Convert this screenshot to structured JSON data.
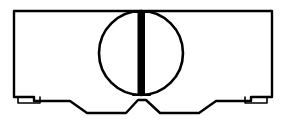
{
  "figure": {
    "kind": "technical-line-drawing",
    "canvas": {
      "width": 285,
      "height": 132,
      "background": "#ffffff"
    },
    "ink_color": "#000000",
    "fill_color": "#ffffff"
  },
  "geometry": {
    "body_outline": {
      "name": "cabinet-body-outline",
      "description": "Rectangular cabinet front with stepped and notched lower edge",
      "stroke_width": 2.4,
      "path": "M 14 11 L 272 11 L 272 97 L 251 97 L 251 101 L 216 101 L 199 113 L 160 113 L 146 100 L 138 100 L 126 113 L 87 113 L 70 101 L 34 101 L 34 97 L 14 97 Z"
    },
    "left_foot": {
      "name": "left-foot",
      "description": "Small rectangular support foot at lower left",
      "stroke_width": 1.6,
      "path": "M 18 97 L 18 103 L 40 103 L 40 97"
    },
    "right_foot": {
      "name": "right-foot",
      "description": "Small rectangular support foot at lower right",
      "stroke_width": 1.6,
      "path": "M 245 97 L 245 103 L 267 103 L 267 97"
    },
    "drum_circle": {
      "name": "drum-circle",
      "description": "Large circular drum / porthole centred on the cabinet face",
      "center_x": 141,
      "center_y": 53,
      "radius": 42,
      "stroke_width": 2.6
    },
    "center_bar": {
      "name": "center-divider-bar",
      "description": "Thick solid vertical bar bisecting the circle",
      "x": 137.5,
      "y_top": 11,
      "width": 7.5,
      "y_bottom": 95,
      "fill": "#000000"
    },
    "bar_cap_top": {
      "name": "bar-top-cap",
      "description": "Short horizontal cap where the bar meets the top edge",
      "stroke_width": 2.2,
      "path": "M 133 12 L 150 12"
    },
    "bar_cap_bottom": {
      "name": "bar-bottom-cap",
      "description": "Short horizontal cap where the bar meets the circle base",
      "stroke_width": 2.2,
      "path": "M 133 95 L 150 95"
    }
  },
  "parts": [
    {
      "id": "cabinet",
      "label": "Cabinet body"
    },
    {
      "id": "drum",
      "label": "Drum circle"
    },
    {
      "id": "divider",
      "label": "Vertical divider bar"
    },
    {
      "id": "left-foot",
      "label": "Left foot"
    },
    {
      "id": "right-foot",
      "label": "Right foot"
    },
    {
      "id": "left-notch",
      "label": "Left bottom notch"
    },
    {
      "id": "right-notch",
      "label": "Right bottom notch"
    }
  ]
}
